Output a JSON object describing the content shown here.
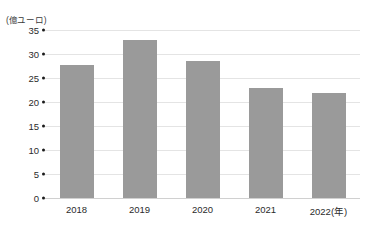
{
  "chart_data": {
    "type": "bar",
    "title": "",
    "subtitle": "",
    "xlabel": "",
    "ylabel": "",
    "unit_label": "(億ユーロ)",
    "categories": [
      "2018",
      "2019",
      "2020",
      "2021",
      "2022(年)"
    ],
    "values": [
      27.7,
      32.9,
      28.5,
      22.9,
      21.9
    ],
    "series": [
      {
        "name": "",
        "values": [
          27.7,
          32.9,
          28.5,
          22.9,
          21.9
        ],
        "color": "#9a9a9a"
      }
    ],
    "ylim": [
      0,
      35
    ],
    "yticks": [
      35,
      30,
      25,
      20,
      15,
      10,
      5,
      0
    ],
    "ytick_labels": [
      "35",
      "30",
      "25",
      "20",
      "15",
      "10",
      "5",
      "0"
    ],
    "grid": true,
    "grid_axis": "y",
    "legend": false,
    "legend_position": "none",
    "annotations": []
  },
  "style": {
    "bar_color": "#9a9a9a",
    "grid_color": "#e4e4e4",
    "baseline_color": "#d0d0d0",
    "text_color": "#2b2b2b",
    "background": "#ffffff"
  }
}
